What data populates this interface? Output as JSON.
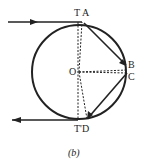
{
  "labels": {
    "ta": "T A",
    "o": "O",
    "b": "B",
    "c": "C",
    "td": "T'D",
    "caption": "(b)"
  }
}
